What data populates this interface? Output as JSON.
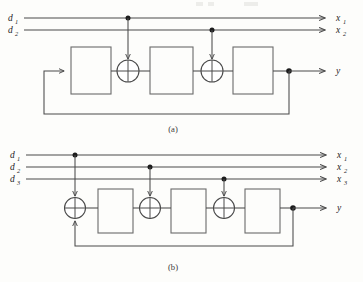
{
  "figure": {
    "colors": {
      "background": "#fdfdfb",
      "wire": "#4a4a4a",
      "block_outline": "#6b6b6b",
      "node_dot": "#1c1c1c",
      "text": "#262626"
    }
  },
  "panels": [
    {
      "id": "a",
      "caption": "(a)",
      "inputs": [
        {
          "base": "d",
          "sub": "1"
        },
        {
          "base": "d",
          "sub": "2"
        }
      ],
      "outputs": [
        {
          "base": "x",
          "sub": "1"
        },
        {
          "base": "x",
          "sub": "2"
        }
      ],
      "signal_output": {
        "base": "y",
        "sub": ""
      },
      "blocks": 3,
      "adders": 2,
      "feedback": "output-to-first-block"
    },
    {
      "id": "b",
      "caption": "(b)",
      "inputs": [
        {
          "base": "d",
          "sub": "1"
        },
        {
          "base": "d",
          "sub": "2"
        },
        {
          "base": "d",
          "sub": "3"
        }
      ],
      "outputs": [
        {
          "base": "x",
          "sub": "1"
        },
        {
          "base": "x",
          "sub": "2"
        },
        {
          "base": "x",
          "sub": "3"
        }
      ],
      "signal_output": {
        "base": "y",
        "sub": ""
      },
      "blocks": 3,
      "adders": 3,
      "feedback": "output-to-first-adder"
    }
  ]
}
